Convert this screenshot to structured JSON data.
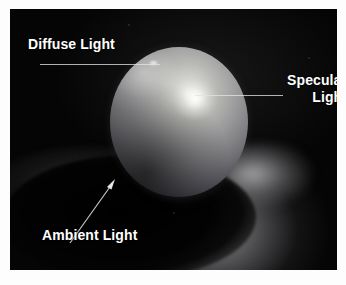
{
  "figure": {
    "background_color": "#ffffff",
    "plate_color": "#050505",
    "label_color": "#ffffff",
    "leader_color": "#e2e2e2"
  },
  "annotations": {
    "diffuse": {
      "label": "Diffuse Light",
      "leader": "horizontal-line-right"
    },
    "specular": {
      "label_line1": "Specular",
      "label_line2": "Light",
      "leader": "horizontal-line-left"
    },
    "ambient": {
      "label": "Ambient Light",
      "leader": "diagonal-arrow-up-right"
    }
  },
  "scene": {
    "objects": [
      {
        "name": "sphere",
        "description": "shaded sphere"
      },
      {
        "name": "cast-shadow",
        "description": "elliptical shadow on floor"
      },
      {
        "name": "floor",
        "description": "ground plane"
      },
      {
        "name": "specular-hotspot",
        "description": "specular highlight on sphere"
      }
    ]
  }
}
